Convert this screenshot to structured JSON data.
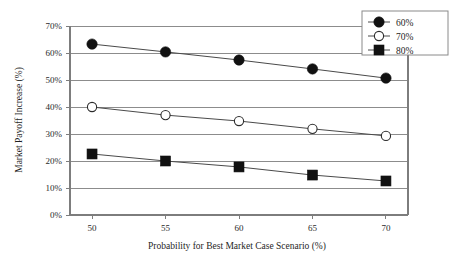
{
  "chart_data": {
    "type": "line",
    "title": "",
    "xlabel": "Probability for Best Market Case Scenario (%)",
    "ylabel": "Market Payoff Increase (%)",
    "x": [
      50,
      55,
      60,
      65,
      70
    ],
    "xtick_labels": [
      "50",
      "55",
      "60",
      "65",
      "70"
    ],
    "ytick_labels": [
      "0%",
      "10%",
      "20%",
      "30%",
      "40%",
      "50%",
      "60%",
      "70%"
    ],
    "ytick_values": [
      0,
      10,
      20,
      30,
      40,
      50,
      60,
      70
    ],
    "xlim": [
      48.5,
      71.5
    ],
    "ylim": [
      0,
      70
    ],
    "grid": "horizontal",
    "legend_position": "top-right",
    "series": [
      {
        "name": "60%",
        "marker": "filled-circle",
        "values": [
          63.3,
          60.4,
          57.4,
          54.1,
          50.7
        ]
      },
      {
        "name": "70%",
        "marker": "open-circle",
        "values": [
          40.0,
          37.0,
          34.8,
          31.9,
          29.3
        ]
      },
      {
        "name": "80%",
        "marker": "filled-square",
        "values": [
          22.6,
          20.0,
          17.8,
          14.8,
          12.6
        ]
      }
    ]
  },
  "legend": {
    "entries": [
      {
        "label": "60%"
      },
      {
        "label": "70%"
      },
      {
        "label": "80%"
      }
    ]
  },
  "colors": {
    "background": "#ffffff",
    "gridline": "#8c8c8c",
    "axis": "#7d7d7d",
    "series_line": "#4a4a4a",
    "marker_fill": "#111111",
    "marker_open_fill": "#ffffff",
    "text": "#1f1f1f"
  }
}
